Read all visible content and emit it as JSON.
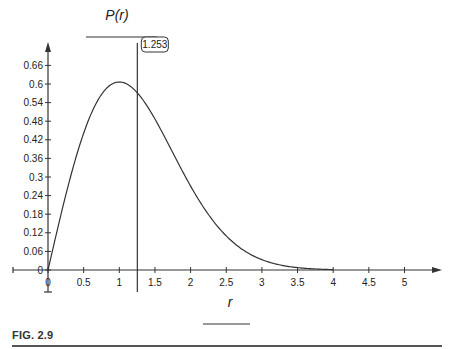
{
  "chart_data": {
    "type": "line",
    "title": "",
    "ylabel": "P(r)",
    "xlabel": "r",
    "function": "P(r) = r * exp(-r^2 / 2)",
    "xlim": [
      0,
      5.6
    ],
    "ylim": [
      0,
      0.7
    ],
    "x_ticks": [
      0,
      0.5,
      1,
      1.5,
      2,
      2.5,
      3,
      3.5,
      4,
      4.5,
      5
    ],
    "x_tick_labels": [
      "0",
      "0.5",
      "1",
      "1.5",
      "2",
      "2.5",
      "3",
      "3.5",
      "4",
      "4.5",
      "5"
    ],
    "y_ticks": [
      0,
      0.06,
      0.12,
      0.18,
      0.24,
      0.3,
      0.36,
      0.42,
      0.48,
      0.54,
      0.6,
      0.66
    ],
    "y_tick_labels": [
      "0",
      "0.06",
      "0.12",
      "0.18",
      "0.24",
      "0.3",
      "0.36",
      "0.42",
      "0.48",
      "0.54",
      "0.6",
      "0.66"
    ],
    "series": [
      {
        "name": "P(r)",
        "x": [
          0,
          0.25,
          0.5,
          0.75,
          1.0,
          1.25,
          1.5,
          1.75,
          2.0,
          2.25,
          2.5,
          2.75,
          3.0,
          3.25,
          3.5,
          3.75,
          4.0
        ],
        "values": [
          0,
          0.242,
          0.441,
          0.566,
          0.607,
          0.572,
          0.487,
          0.379,
          0.271,
          0.179,
          0.11,
          0.062,
          0.033,
          0.016,
          0.008,
          0.003,
          0.001
        ]
      }
    ],
    "annotations": [
      {
        "type": "vertical-line",
        "x": 1.253,
        "label": "1.253"
      }
    ],
    "grid": false,
    "legend": "none"
  },
  "figure": {
    "caption": "FIG. 2.9",
    "callout_label": "1.253",
    "y_axis_title": "P(r)",
    "x_axis_title": "r"
  }
}
